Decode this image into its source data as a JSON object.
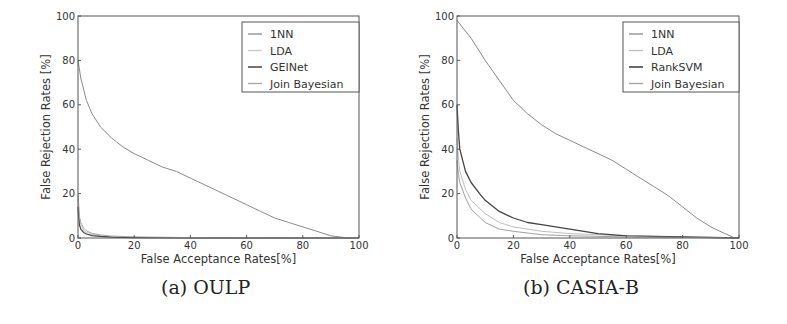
{
  "chart_data": [
    {
      "type": "line",
      "panel": "a",
      "title": "(a) OULP",
      "xlabel": "False Acceptance Rates[%]",
      "ylabel": "False Rejection Rates [%]",
      "xlim": [
        0,
        100
      ],
      "ylim": [
        0,
        100
      ],
      "xticks": [
        0,
        20,
        40,
        60,
        80,
        100
      ],
      "yticks": [
        0,
        20,
        40,
        60,
        80,
        100
      ],
      "grid": false,
      "legend_position": "upper right",
      "series": [
        {
          "name": "1NN",
          "color": "#8a8a8a",
          "width": 1.0,
          "x": [
            0,
            1,
            3,
            5,
            8,
            12,
            16,
            20,
            25,
            30,
            35,
            40,
            45,
            50,
            55,
            60,
            65,
            70,
            75,
            80,
            85,
            90,
            95,
            100
          ],
          "y": [
            80,
            72,
            62,
            56,
            50,
            45,
            41,
            38,
            35,
            32,
            30,
            27,
            24,
            21,
            18,
            15,
            12,
            9,
            7,
            5,
            3,
            1,
            0.2,
            0
          ]
        },
        {
          "name": "LDA",
          "color": "#c8c8c8",
          "width": 1.0,
          "x": [
            0,
            0.5,
            1,
            2,
            3,
            5,
            8,
            12,
            20,
            40,
            100
          ],
          "y": [
            18,
            9,
            6,
            3.5,
            2.5,
            1.6,
            1.0,
            0.6,
            0.3,
            0.1,
            0
          ]
        },
        {
          "name": "GEINet",
          "color": "#444444",
          "width": 1.2,
          "x": [
            0,
            0.5,
            1,
            2,
            3,
            5,
            8,
            12,
            20,
            40,
            100
          ],
          "y": [
            14,
            6,
            4,
            2.5,
            1.8,
            1.1,
            0.7,
            0.4,
            0.2,
            0.05,
            0
          ]
        },
        {
          "name": "Join Bayesian",
          "color": "#a8a8a8",
          "width": 1.0,
          "x": [
            0,
            0.5,
            1,
            2,
            3,
            5,
            8,
            12,
            20,
            40,
            100
          ],
          "y": [
            20,
            10,
            7,
            4.5,
            3.2,
            2.1,
            1.4,
            0.9,
            0.5,
            0.2,
            0
          ]
        }
      ]
    },
    {
      "type": "line",
      "panel": "b",
      "title": "(b) CASIA-B",
      "xlabel": "False Acceptance Rates[%]",
      "ylabel": "False Rejection Rates [%]",
      "xlim": [
        0,
        100
      ],
      "ylim": [
        0,
        100
      ],
      "xticks": [
        0,
        20,
        40,
        60,
        80,
        100
      ],
      "yticks": [
        0,
        20,
        40,
        60,
        80,
        100
      ],
      "grid": false,
      "legend_position": "upper right",
      "series": [
        {
          "name": "1NN",
          "color": "#8a8a8a",
          "width": 1.0,
          "x": [
            0,
            5,
            10,
            15,
            20,
            25,
            30,
            35,
            40,
            45,
            50,
            55,
            60,
            65,
            70,
            75,
            80,
            85,
            90,
            95,
            98,
            100
          ],
          "y": [
            98,
            90,
            80,
            71,
            62,
            56,
            51,
            47,
            44,
            41,
            38,
            35,
            31,
            27,
            23,
            19,
            14,
            9,
            5,
            2,
            0.3,
            0
          ]
        },
        {
          "name": "LDA",
          "color": "#bdbdbd",
          "width": 1.0,
          "x": [
            0,
            0.5,
            1,
            3,
            5,
            10,
            15,
            20,
            30,
            40,
            60,
            100
          ],
          "y": [
            45,
            36,
            30,
            22,
            17,
            11,
            7,
            5,
            3,
            2,
            1,
            0
          ]
        },
        {
          "name": "RankSVM",
          "color": "#444444",
          "width": 1.3,
          "x": [
            0,
            0.5,
            1,
            3,
            5,
            8,
            10,
            15,
            20,
            25,
            30,
            40,
            45,
            50,
            60,
            80,
            100
          ],
          "y": [
            60,
            48,
            40,
            30,
            25,
            20,
            17,
            12,
            9,
            7,
            6,
            4,
            3,
            2,
            1,
            0.5,
            0
          ]
        },
        {
          "name": "Join Bayesian",
          "color": "#a0a0a0",
          "width": 1.0,
          "x": [
            0,
            0.5,
            1,
            3,
            5,
            10,
            15,
            20,
            30,
            40,
            60,
            100
          ],
          "y": [
            35,
            29,
            25,
            18,
            13,
            7,
            4,
            3,
            1.5,
            1,
            0.5,
            0
          ]
        }
      ]
    }
  ],
  "panels": {
    "a": {
      "caption": "(a) OULP",
      "legend": [
        "1NN",
        "LDA",
        "GEINet",
        "Join Bayesian"
      ]
    },
    "b": {
      "caption": "(b) CASIA-B",
      "legend": [
        "1NN",
        "LDA",
        "RankSVM",
        "Join Bayesian"
      ]
    }
  }
}
